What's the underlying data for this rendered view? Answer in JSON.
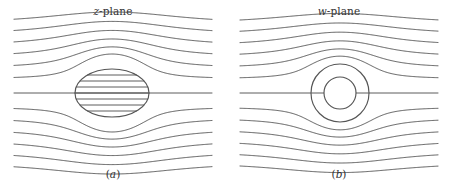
{
  "figure": {
    "background_color": "#ffffff",
    "line_color": "#4a4a4a",
    "outline_color": "#555555",
    "width": 452,
    "height": 185
  },
  "panels": [
    {
      "id": "z-plane",
      "title_symbol": "z",
      "title_rest": "-plane",
      "caption_open": "(",
      "caption_symbol": "a",
      "caption_close": ")",
      "obstacle": {
        "shape": "ellipse",
        "cx": 112,
        "cy": 93,
        "rx": 37,
        "ry": 24,
        "interior": "streamlines-pass-through"
      }
    },
    {
      "id": "w-plane",
      "title_symbol": "w",
      "title_rest": "-plane",
      "caption_open": "(",
      "caption_symbol": "b",
      "caption_close": ")",
      "obstacle": {
        "shape": "circle",
        "cx": 114,
        "cy": 93,
        "r_outer": 29,
        "r_inner": 16,
        "interior": "empty-core"
      }
    }
  ],
  "chart_data": {
    "type": "line",
    "xlabel": "",
    "ylabel": "",
    "grid": false,
    "legend_position": "none",
    "axis_of_symmetry_y": 93,
    "x_extent": [
      14,
      212
    ],
    "streamline_count": 13,
    "streamline_inlet_y": [
      24,
      35,
      46,
      57,
      68,
      79,
      93,
      107,
      118,
      129,
      140,
      151,
      162
    ],
    "streamline_offsets_from_axis": [
      -69,
      -58,
      -47,
      -36,
      -25,
      -14,
      0,
      14,
      25,
      36,
      47,
      58,
      69
    ],
    "series": [
      {
        "name": "z-plane streamlines",
        "description": "Uniform horizontal flow deflected around a horizontal ellipse; interior of the ellipse is ruled with horizontal line segments.",
        "obstacle_cx": 112,
        "obstacle_cy": 93,
        "obstacle_rx": 37,
        "obstacle_ry": 24,
        "interior_line_offsets": [
          -18,
          -12,
          -6,
          0,
          6,
          12,
          18
        ]
      },
      {
        "name": "w-plane streamlines",
        "description": "Uniform horizontal flow deflected around a circle; nested arcs hug the circle and an empty inner circle marks the core.",
        "obstacle_cx": 114,
        "obstacle_cy": 93,
        "obstacle_r_outer": 29,
        "obstacle_r_inner": 16,
        "interior_line_offsets": [
          0
        ]
      }
    ]
  }
}
